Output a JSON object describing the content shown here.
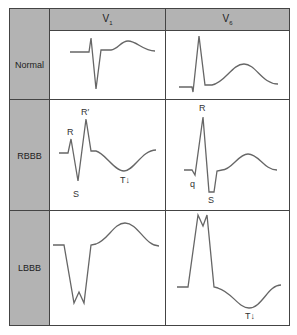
{
  "headers": {
    "corner": "",
    "col1": {
      "base": "V",
      "sub": "1"
    },
    "col2": {
      "base": "V",
      "sub": "6"
    }
  },
  "rows": [
    {
      "label": "Normal"
    },
    {
      "label": "RBBB"
    },
    {
      "label": "LBBB"
    }
  ],
  "annotations": {
    "rbbb_v1": {
      "r": "R",
      "r_prime": "R′",
      "s": "S",
      "t": "T↓"
    },
    "rbbb_v6": {
      "r": "R",
      "q": "q",
      "s": "S"
    },
    "lbbb_v6": {
      "t": "T↓"
    }
  },
  "colors": {
    "header_fill": "#b3b3b3",
    "border": "#444444",
    "trace": "#666666"
  }
}
